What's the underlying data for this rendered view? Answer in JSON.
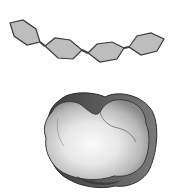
{
  "figure": {
    "colors": {
      "background": "#ffffff",
      "hexagon_fill": "#bdbdbd",
      "hexagon_stroke": "#3a3a3a",
      "blob_light": "#f4f4f4",
      "blob_mid": "#c9c9c9",
      "blob_dark": "#4a4a4a"
    },
    "chain": {
      "hexagons": [
        {
          "points": "10,23 23,20 36,29 40,42 27,45 14,36"
        },
        {
          "points": "45,46 55,38 70,40 82,50 73,59 58,58"
        },
        {
          "points": "88,53 97,44 112,42 124,48 117,59 100,62"
        },
        {
          "points": "129,47 137,36 151,33 164,39 157,51 141,55"
        }
      ],
      "links": [
        {
          "x1": 40,
          "y1": 42,
          "x2": 45,
          "y2": 46
        },
        {
          "x1": 82,
          "y1": 50,
          "x2": 88,
          "y2": 53
        },
        {
          "x1": 124,
          "y1": 48,
          "x2": 129,
          "y2": 47
        }
      ]
    }
  }
}
